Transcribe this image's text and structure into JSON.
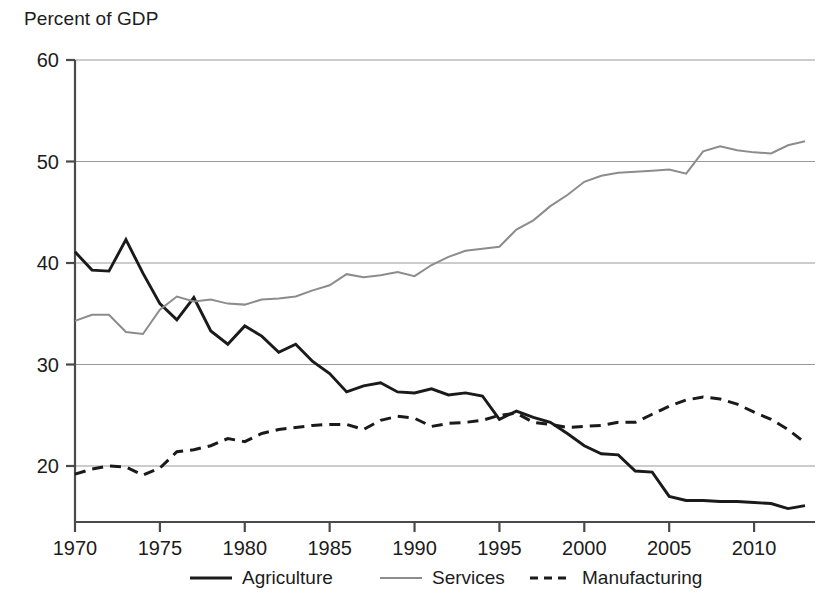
{
  "chart_data": {
    "type": "line",
    "title": "Percent of GDP",
    "xlabel": "",
    "ylabel": "Percent of GDP",
    "xlim": [
      1970,
      2013
    ],
    "ylim": [
      16,
      60
    ],
    "ytick_values": [
      20,
      30,
      40,
      50,
      60
    ],
    "ytick_labels": [
      "20",
      "30",
      "40",
      "50",
      "60"
    ],
    "xtick_values": [
      1970,
      1975,
      1980,
      1985,
      1990,
      1995,
      2000,
      2005,
      2010
    ],
    "xtick_labels": [
      "1970",
      "1975",
      "1980",
      "1985",
      "1990",
      "1995",
      "2000",
      "2005",
      "2010"
    ],
    "grid": "horizontal",
    "legend_position": "bottom",
    "x": [
      1970,
      1971,
      1972,
      1973,
      1974,
      1975,
      1976,
      1977,
      1978,
      1979,
      1980,
      1981,
      1982,
      1983,
      1984,
      1985,
      1986,
      1987,
      1988,
      1989,
      1990,
      1991,
      1992,
      1993,
      1994,
      1995,
      1996,
      1997,
      1998,
      1999,
      2000,
      2001,
      2002,
      2003,
      2004,
      2005,
      2006,
      2007,
      2008,
      2009,
      2010,
      2011,
      2012,
      2013
    ],
    "series": [
      {
        "name": "Agriculture",
        "style": "solid",
        "color": "#1a1a1a",
        "values": [
          41.1,
          39.3,
          39.2,
          42.3,
          39.0,
          36.0,
          34.4,
          36.6,
          33.3,
          32.0,
          33.8,
          32.8,
          31.2,
          32.0,
          30.3,
          29.1,
          27.3,
          27.9,
          28.2,
          27.3,
          27.2,
          27.6,
          27.0,
          27.2,
          26.9,
          24.6,
          25.4,
          24.8,
          24.3,
          23.2,
          22.0,
          21.2,
          21.1,
          19.5,
          19.4,
          17.0,
          16.6,
          16.6,
          16.5,
          16.5,
          16.4,
          16.3,
          15.8,
          16.1
        ]
      },
      {
        "name": "Services",
        "style": "solid",
        "color": "#8c8c8c",
        "values": [
          34.3,
          34.9,
          34.9,
          33.2,
          33.0,
          35.4,
          36.7,
          36.2,
          36.4,
          36.0,
          35.9,
          36.4,
          36.5,
          36.7,
          37.3,
          37.8,
          38.9,
          38.6,
          38.8,
          39.1,
          38.7,
          39.8,
          40.6,
          41.2,
          41.4,
          41.6,
          43.3,
          44.2,
          45.6,
          46.7,
          48.0,
          48.6,
          48.9,
          49.0,
          49.1,
          49.2,
          48.8,
          51.0,
          51.5,
          51.1,
          50.9,
          50.8,
          51.6,
          52.0
        ]
      },
      {
        "name": "Manufacturing",
        "style": "dashed",
        "color": "#1a1a1a",
        "values": [
          19.2,
          19.7,
          20.0,
          19.9,
          19.1,
          19.8,
          21.4,
          21.6,
          22.0,
          22.7,
          22.4,
          23.2,
          23.6,
          23.8,
          24.0,
          24.1,
          24.1,
          23.6,
          24.5,
          24.9,
          24.7,
          23.9,
          24.2,
          24.3,
          24.5,
          25.0,
          25.2,
          24.3,
          24.1,
          23.8,
          23.9,
          24.0,
          24.3,
          24.3,
          25.1,
          25.9,
          26.5,
          26.8,
          26.6,
          26.1,
          25.3,
          24.6,
          23.6,
          22.3
        ]
      }
    ],
    "legend": [
      {
        "label": "Agriculture",
        "style": "solid",
        "color": "#1a1a1a"
      },
      {
        "label": "Services",
        "style": "solid",
        "color": "#8c8c8c"
      },
      {
        "label": "Manufacturing",
        "style": "dashed",
        "color": "#1a1a1a"
      }
    ],
    "axis_color": "#4a4a4a",
    "grid_color": "#9a9a9a"
  }
}
